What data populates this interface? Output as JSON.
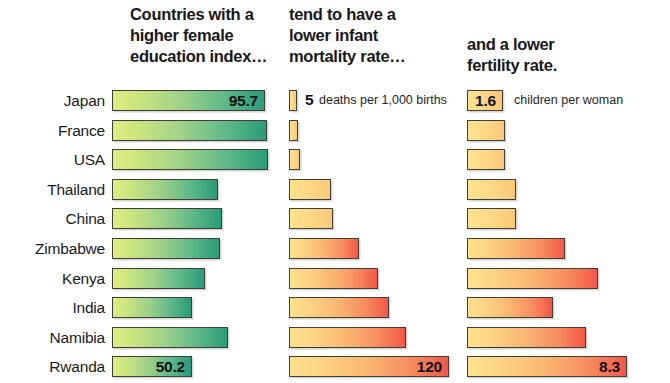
{
  "headers": [
    {
      "text": "Countries with a\nhigher female\neducation index…"
    },
    {
      "text": "tend to have a\nlower infant\nmortality rate…"
    },
    {
      "text": "and a lower\nfertility rate."
    }
  ],
  "legends": {
    "mortality_number": "5",
    "mortality_unit": "deaths per 1,000 births",
    "fertility_number": "1.6",
    "fertility_unit": "children per woman"
  },
  "chart_data": {
    "type": "bar",
    "title": "Countries with a higher female education index… tend to have a lower infant mortality rate… and a lower fertility rate.",
    "orientation": "horizontal",
    "grid": false,
    "legend_position": "inline-first-row",
    "categories": [
      "Japan",
      "France",
      "USA",
      "Thailand",
      "China",
      "Zimbabwe",
      "Kenya",
      "India",
      "Namibia",
      "Rwanda"
    ],
    "series": [
      {
        "name": "Female education index",
        "unit": "index",
        "color_start": "#dfec84",
        "color_end": "#2a9b77",
        "labelled": {
          "Japan": "95.7",
          "Rwanda": "50.2"
        },
        "values": [
          95.7,
          96.4,
          96.6,
          79.0,
          80.3,
          79.6,
          74.6,
          69.9,
          82.4,
          50.2
        ],
        "bar_pixel_lengths": [
          153,
          155,
          156,
          106,
          110,
          108,
          93,
          80,
          116,
          80
        ]
      },
      {
        "name": "Infant mortality rate",
        "unit": "deaths per 1,000 births",
        "color_start": "#fde28e",
        "color_end": "#f4564a",
        "labelled": {
          "Japan": "5",
          "Rwanda": "120"
        },
        "values": [
          5,
          6,
          7,
          29,
          31,
          49,
          62,
          72,
          83,
          120
        ],
        "bar_pixel_lengths": [
          8,
          9,
          11,
          42,
          44,
          70,
          89,
          100,
          117,
          160
        ]
      },
      {
        "name": "Fertility rate",
        "unit": "children per woman",
        "color_start": "#fde28e",
        "color_end": "#f4564a",
        "labelled": {
          "Japan": "1.6",
          "Rwanda": "8.3"
        },
        "values": [
          1.6,
          1.8,
          2.0,
          2.2,
          2.2,
          4.6,
          6.2,
          3.8,
          5.8,
          8.3
        ],
        "bar_pixel_lengths": [
          36,
          38,
          38,
          49,
          49,
          98,
          131,
          86,
          119,
          160
        ]
      }
    ]
  }
}
